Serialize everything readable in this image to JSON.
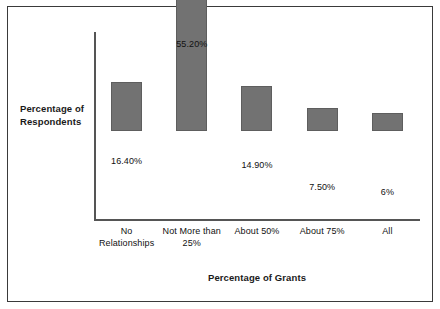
{
  "figure": {
    "background_color": "#ffffff",
    "frame_color": "#3a3a3a",
    "bar_color": "#727272",
    "axis_color": "#555555",
    "text_color": "#111111"
  },
  "chart_data": {
    "type": "bar",
    "title": "",
    "subtitle": "",
    "xlabel": "Percentage of Grants",
    "ylabel": "Percentage of Respondents",
    "categories": [
      "No Relationships",
      "Not More than 25%",
      "About 50%",
      "About 75%",
      "All"
    ],
    "category_lines": [
      [
        "No",
        "Relationships"
      ],
      [
        "Not More than",
        "25%"
      ],
      [
        "About 50%"
      ],
      [
        "About 75%"
      ],
      [
        "All"
      ]
    ],
    "values": [
      16.4,
      55.2,
      14.9,
      7.5,
      6.0
    ],
    "value_labels": [
      "16.40%",
      "55.20%",
      "14.90%",
      "7.50%",
      "6%"
    ],
    "ylim": [
      0,
      62
    ],
    "grid": false,
    "legend": false,
    "y_tick_labels": [],
    "series": [
      {
        "name": "Percentage of Respondents",
        "values": [
          16.4,
          55.2,
          14.9,
          7.5,
          6.0
        ]
      }
    ]
  }
}
